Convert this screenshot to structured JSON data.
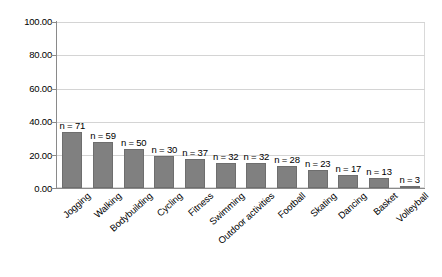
{
  "chart_data": {
    "type": "bar",
    "title": "",
    "subtitle": "",
    "xlabel": "",
    "ylabel": "",
    "ylim": [
      0,
      100
    ],
    "yticks": [
      "0.00",
      "20.00",
      "40.00",
      "60.00",
      "80.00",
      "100.00"
    ],
    "ytick_values": [
      0,
      20,
      40,
      60,
      80,
      100
    ],
    "grid": true,
    "legend": "none",
    "orientation": "vertical",
    "bar_color": "#808080",
    "categories": [
      "Jogging",
      "Walking",
      "Bodybuilding",
      "Cycling",
      "Fitness",
      "Swimming",
      "Outdoor activities",
      "Football",
      "Skating",
      "Dancing",
      "Basket",
      "Volleyball"
    ],
    "values": [
      33.5,
      27.8,
      23.5,
      19.0,
      17.4,
      15.1,
      15.1,
      13.2,
      10.8,
      8.0,
      6.1,
      1.4
    ],
    "annotations": [
      "n = 71",
      "n = 59",
      "n = 50",
      "n = 30",
      "n = 37",
      "n = 32",
      "n = 32",
      "n = 28",
      "n = 23",
      "n = 17",
      "n = 13",
      "n = 3"
    ]
  }
}
